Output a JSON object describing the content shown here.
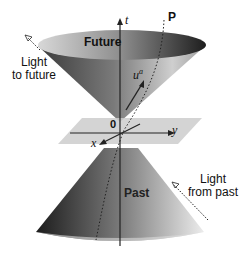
{
  "diagram": {
    "labels": {
      "future": "Future",
      "past": "Past",
      "light_to_future_line1": "Light",
      "light_to_future_line2": "to future",
      "light_from_past_line1": "Light",
      "light_from_past_line2": "from past",
      "t_axis": "t",
      "x_axis": "x",
      "y_axis": "y",
      "origin": "0",
      "point": "P",
      "four_velocity": "u",
      "four_velocity_sup": "a"
    },
    "colors": {
      "cone_dark": "#2a2a2a",
      "cone_mid": "#8a8a8a",
      "cone_light": "#e0e0e0",
      "plane": "#c8c8c8",
      "axis": "#222222"
    }
  }
}
